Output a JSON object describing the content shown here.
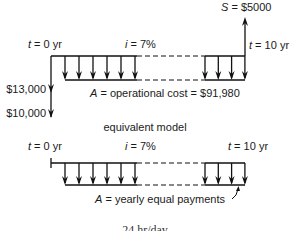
{
  "top_diagram": {
    "start_label": {
      "var": "t",
      "rest": " = 0 yr"
    },
    "rate_label": {
      "var": "i",
      "rest": " = 7%"
    },
    "end_label": {
      "var": "t",
      "rest": " = 10 yr"
    },
    "salvage_label": {
      "var": "S",
      "rest": " = $5000"
    },
    "initial_cost_1": "$13,000",
    "initial_cost_2": "$10,000",
    "annual_label": {
      "var": "A",
      "rest": " = operational cost = $91,980"
    },
    "left_arrow_count": 6,
    "right_arrow_count": 4
  },
  "separator_label": "equivalent model",
  "bottom_diagram": {
    "start_label": {
      "var": "t",
      "rest": " = 0 yr"
    },
    "rate_label": {
      "var": "i",
      "rest": " = 7%"
    },
    "end_label": {
      "var": "t",
      "rest": " = 10 yr"
    },
    "annual_label": {
      "var": "A",
      "rest": " = yearly equal payments"
    },
    "left_arrow_count": 6,
    "right_arrow_count": 4
  },
  "footer_text": "24 hr/day"
}
